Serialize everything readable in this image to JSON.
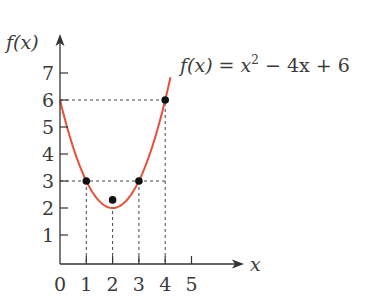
{
  "chart_data": {
    "type": "line",
    "title": "",
    "function_label": "f(x) = x² − 4x + 6",
    "xlabel": "x",
    "ylabel": "f(x)",
    "x_ticks": [
      "0",
      "1",
      "2",
      "3",
      "4",
      "5"
    ],
    "y_ticks": [
      "1",
      "2",
      "3",
      "4",
      "5",
      "6",
      "7"
    ],
    "xlim": [
      0,
      5
    ],
    "ylim": [
      0,
      7
    ],
    "grid": false,
    "legend": null,
    "series": [
      {
        "name": "f(x) = x^2 - 4x + 6",
        "color": "#e8503a",
        "x": [
          0,
          0.5,
          1,
          1.5,
          2,
          2.5,
          3,
          3.5,
          4,
          4.2
        ],
        "y": [
          6,
          4.25,
          3,
          2.25,
          2,
          2.25,
          3,
          4.25,
          6,
          6.84
        ]
      }
    ],
    "marked_points": [
      {
        "x": 1,
        "y": 3
      },
      {
        "x": 2,
        "y": 2
      },
      {
        "x": 3,
        "y": 3
      },
      {
        "x": 4,
        "y": 6
      }
    ],
    "guide_lines": [
      {
        "type": "horizontal",
        "y": 6,
        "from_x": 0,
        "to_x": 4
      },
      {
        "type": "horizontal",
        "y": 3,
        "from_x": 0,
        "to_x": 4
      },
      {
        "type": "vertical",
        "x": 1,
        "from_y": 0,
        "to_y": 3
      },
      {
        "type": "vertical",
        "x": 2,
        "from_y": 0,
        "to_y": 2
      },
      {
        "type": "vertical",
        "x": 3,
        "from_y": 0,
        "to_y": 3
      },
      {
        "type": "vertical",
        "x": 4,
        "from_y": 0,
        "to_y": 6
      }
    ]
  },
  "labels": {
    "y_axis": "f(x)",
    "x_axis": "x",
    "equation_prefix": "f(x) = x",
    "equation_exp": "2",
    "equation_suffix": " − 4x + 6"
  },
  "colors": {
    "curve": "#e8503a",
    "axis": "#333333",
    "point": "#111111",
    "guide": "#444444"
  }
}
